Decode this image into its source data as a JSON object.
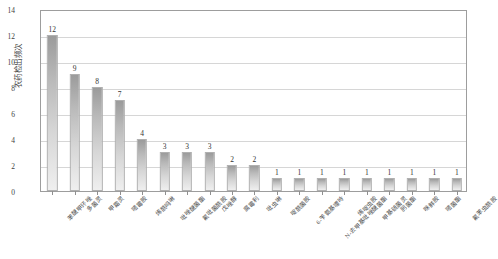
{
  "chart_data": {
    "type": "bar",
    "title": "",
    "subtitle": "",
    "xlabel": "",
    "ylabel": "农药检出频次",
    "ylim": [
      0,
      14
    ],
    "yticks": [
      0,
      2,
      4,
      6,
      8,
      10,
      12,
      14
    ],
    "grid": true,
    "legend": null,
    "data_labels": true,
    "categories": [
      "苯醚甲环唑",
      "多菌灵",
      "甲霜灵",
      "嘧霉胺",
      "烯酰吗啉",
      "吡唑醚菌酯",
      "氟吡菌酰胺",
      "戊唑醇",
      "腐霉利",
      "吡虫啉",
      "啶酰菌胺",
      "6-苄氨基嘌呤",
      "N-去甲基吡唑醚菌酯",
      "烯啶虫胺",
      "甲基硫菌灵",
      "肟菌酯",
      "咪鲜胺",
      "嘧菌酯",
      "氟苯虫酰胺"
    ],
    "values": [
      12,
      9,
      8,
      7,
      4,
      3,
      3,
      3,
      2,
      2,
      1,
      1,
      1,
      1,
      1,
      1,
      1,
      1,
      1
    ],
    "bar_color_top": "#9b9b9b",
    "bar_color_bottom": "#efefef",
    "bar_border_color": "#b0b0b0",
    "grid_color": "#d6d6d6",
    "axis_color": "#9d9d9d"
  }
}
